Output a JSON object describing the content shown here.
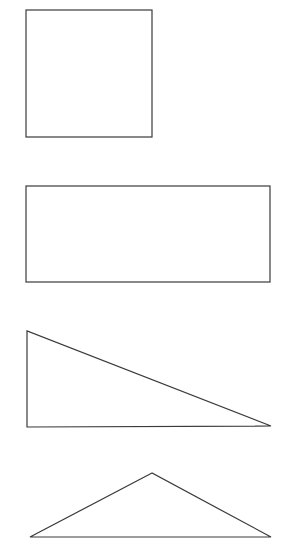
{
  "diagram": {
    "background": "#ffffff",
    "stroke_color": "#3a3a3a",
    "shapes": [
      {
        "name": "square",
        "type": "rect",
        "x": 26,
        "y": 10,
        "width": 126,
        "height": 127
      },
      {
        "name": "rectangle",
        "type": "rect",
        "x": 26,
        "y": 186,
        "width": 244,
        "height": 96
      },
      {
        "name": "right-triangle",
        "type": "polygon",
        "points": "27,331 27,427 271,426"
      },
      {
        "name": "isosceles-triangle",
        "type": "polygon",
        "points": "152,473 30,537 271,537"
      }
    ]
  }
}
